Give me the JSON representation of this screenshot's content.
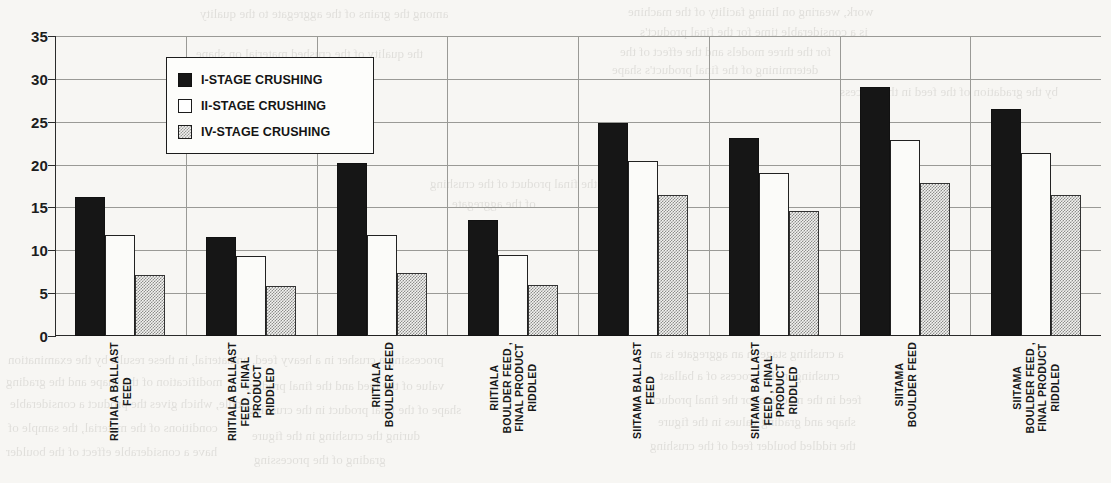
{
  "chart_data": {
    "type": "bar",
    "title": "",
    "xlabel": "",
    "ylabel": "",
    "ylim": [
      0,
      35
    ],
    "yticks": [
      0,
      5,
      10,
      15,
      20,
      25,
      30,
      35
    ],
    "grid": true,
    "legend_position": "inside-upper-left",
    "categories": [
      "RIITIALA BALLAST\nFEED",
      "RIITIALA BALLAST\nFEED , FINAL\nPRODUCT\nRIDDLED",
      "RIITIALA\nBOULDER FEED",
      "RIITIALA\nBOULDER FEED ,\nFINAL PRODUCT\nRIDDLED",
      "SIITAMA BALLAST\nFEED",
      "SIITAMA BALLAST\nFEED , FINAL\nPRODUCT\nRIDDLED",
      "SIITAMA\nBOULDER FEED",
      "SIITAMA\nBOULDER FEED ,\nFINAL PRODUCT\nRIDDLED"
    ],
    "series": [
      {
        "name": "I-STAGE CRUSHING",
        "color": "#161616",
        "fill": "solid-black",
        "values": [
          16.2,
          11.6,
          20.2,
          13.5,
          24.8,
          23.1,
          29.1,
          26.5
        ]
      },
      {
        "name": "II-STAGE CRUSHING",
        "color": "#ffffff",
        "fill": "white-outline",
        "values": [
          11.8,
          9.3,
          11.8,
          9.5,
          20.4,
          19.0,
          22.9,
          21.3
        ]
      },
      {
        "name": "IV-STAGE CRUSHING",
        "color": "#8d8d8b",
        "fill": "gray-dither",
        "values": [
          7.1,
          5.8,
          7.3,
          6.0,
          16.4,
          14.6,
          17.8,
          16.5
        ]
      }
    ]
  },
  "legend": {
    "items": [
      {
        "label": "I-STAGE CRUSHING",
        "swatch": "solid-black-swatch"
      },
      {
        "label": "II-STAGE CRUSHING",
        "swatch": "white-outline-swatch"
      },
      {
        "label": "IV-STAGE CRUSHING",
        "swatch": "gray-dither-swatch"
      }
    ]
  },
  "bleed_text": [
    {
      "text": "work, wearing on lining facility of the machine",
      "x": 628,
      "y": 4,
      "size": 13
    },
    {
      "text": "is a considerable time for the final product's",
      "x": 640,
      "y": 24,
      "size": 13
    },
    {
      "text": "among the grains of the aggregate to the quality",
      "x": 200,
      "y": 6,
      "size": 13
    },
    {
      "text": "for the three models and the effect of the",
      "x": 620,
      "y": 44,
      "size": 13
    },
    {
      "text": "determining of the final product's shape",
      "x": 612,
      "y": 62,
      "size": 13
    },
    {
      "text": "the quality of the crushed material on shape",
      "x": 196,
      "y": 46,
      "size": 13
    },
    {
      "text": "by the gradation of the feed in the process",
      "x": 840,
      "y": 84,
      "size": 13
    },
    {
      "text": "and the final product of the crushing",
      "x": 430,
      "y": 176,
      "size": 13
    },
    {
      "text": "of the aggregate",
      "x": 452,
      "y": 196,
      "size": 13
    },
    {
      "text": "material, in these results by the examination",
      "x": 8,
      "y": 352,
      "size": 13
    },
    {
      "text": "processing a crusher in a heavy feed, and",
      "x": 230,
      "y": 352,
      "size": 13
    },
    {
      "text": "value of the feed and the final product",
      "x": 246,
      "y": 378,
      "size": 13
    },
    {
      "text": "modification of the shape and the grading",
      "x": 6,
      "y": 374,
      "size": 13
    },
    {
      "text": "riddle, which gives the product a considerable",
      "x": 10,
      "y": 396,
      "size": 13
    },
    {
      "text": "shape of the final product in the crushing",
      "x": 248,
      "y": 402,
      "size": 13
    },
    {
      "text": "conditions of the material, the sample of",
      "x": 8,
      "y": 420,
      "size": 13
    },
    {
      "text": "during the crushing in the figure",
      "x": 252,
      "y": 428,
      "size": 13
    },
    {
      "text": "have a considerable effect of the boulder",
      "x": 6,
      "y": 444,
      "size": 13
    },
    {
      "text": "grading of the processing",
      "x": 254,
      "y": 452,
      "size": 13
    },
    {
      "text": "a crushing stage in an aggregate is an",
      "x": 650,
      "y": 346,
      "size": 13
    },
    {
      "text": "crushing in the process of a ballast",
      "x": 660,
      "y": 368,
      "size": 13
    },
    {
      "text": "feed in the machine for the final product",
      "x": 652,
      "y": 392,
      "size": 13
    },
    {
      "text": "shape and grading values in the figure",
      "x": 658,
      "y": 414,
      "size": 13
    },
    {
      "text": "the riddled boulder feed of the crushing",
      "x": 650,
      "y": 438,
      "size": 13
    }
  ]
}
